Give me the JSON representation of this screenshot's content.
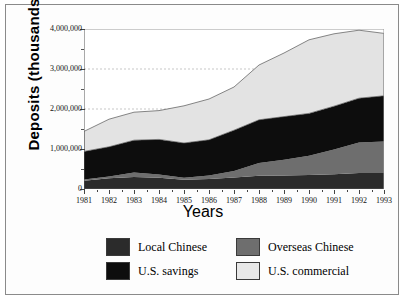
{
  "chart_data": {
    "type": "area",
    "title": "",
    "xlabel": "Years",
    "ylabel": "Deposits (thousands US$)",
    "stacked": true,
    "grid": "horizontal dashed at 2,000,000 and 3,000,000",
    "legend_position": "bottom",
    "xlim": [
      1981,
      1993
    ],
    "ylim": [
      0,
      4000000
    ],
    "ytick_labels": [
      "4,000,000",
      "3,000,000",
      "2,000,000",
      "1,000,000",
      "0"
    ],
    "ytick_values": [
      4000000,
      3000000,
      2000000,
      1000000,
      0
    ],
    "categories": [
      1981,
      1982,
      1983,
      1984,
      1985,
      1986,
      1987,
      1988,
      1989,
      1990,
      1991,
      1992,
      1993
    ],
    "xtick_labels": [
      "1981",
      "1982",
      "1983",
      "1984",
      "1985",
      "1986",
      "1987",
      "1988",
      "1989",
      "1990",
      "1991",
      "1992",
      "1993"
    ],
    "series": [
      {
        "name": "Local Chinese",
        "color": "#2b2b2b",
        "values": [
          205000,
          270000,
          300000,
          280000,
          230000,
          250000,
          290000,
          330000,
          340000,
          350000,
          370000,
          400000,
          400000
        ]
      },
      {
        "name": "Overseas Chinese",
        "color": "#6e6e6e",
        "values": [
          35000,
          45000,
          110000,
          80000,
          50000,
          90000,
          160000,
          320000,
          390000,
          480000,
          620000,
          760000,
          790000
        ]
      },
      {
        "name": "U.S. savings",
        "color": "#0d0d0d",
        "values": [
          700000,
          740000,
          810000,
          880000,
          870000,
          890000,
          1020000,
          1080000,
          1080000,
          1060000,
          1080000,
          1110000,
          1140000
        ]
      },
      {
        "name": "U.S. commercial",
        "color": "#e3e3e3",
        "values": [
          500000,
          690000,
          700000,
          720000,
          930000,
          1020000,
          1080000,
          1370000,
          1590000,
          1840000,
          1810000,
          1700000,
          1560000
        ]
      }
    ],
    "series_totals": [
      1440000,
      1745000,
      1920000,
      1960000,
      2080000,
      2250000,
      2550000,
      3100000,
      3400000,
      3730000,
      3880000,
      3970000,
      3890000
    ]
  },
  "legend": {
    "entries": [
      {
        "label": "Local Chinese",
        "color": "#2b2b2b"
      },
      {
        "label": "Overseas Chinese",
        "color": "#6e6e6e"
      },
      {
        "label": "U.S. savings",
        "color": "#0d0d0d"
      },
      {
        "label": "U.S. commercial",
        "color": "#e8e8e8"
      }
    ]
  }
}
